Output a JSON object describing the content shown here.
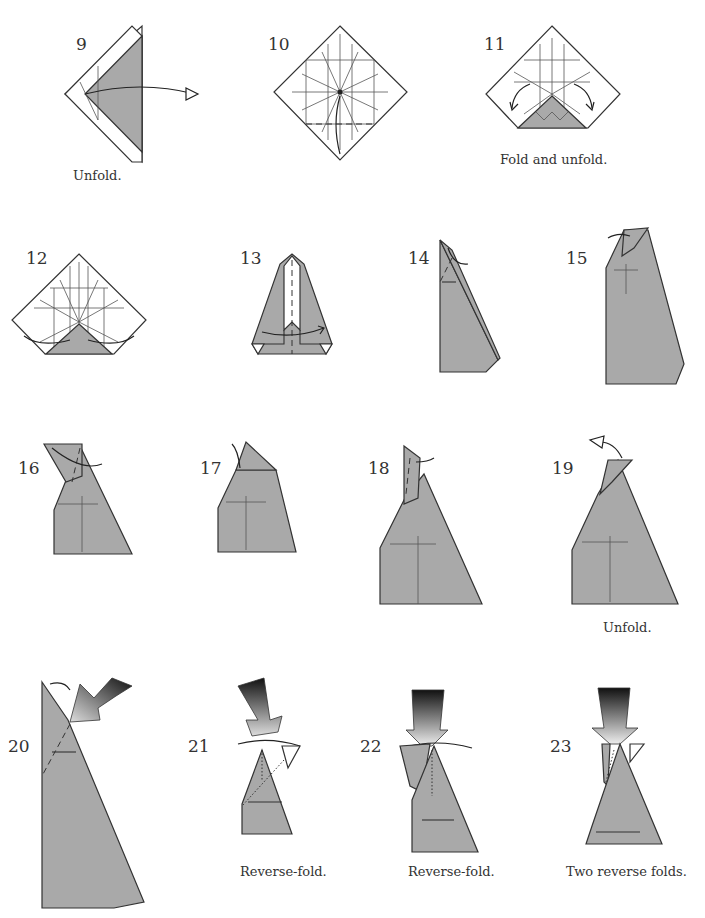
{
  "diagram": {
    "colors": {
      "paper": "#a9a9a9",
      "line": "#333333",
      "background": "#ffffff"
    },
    "steps": [
      {
        "number": "9",
        "caption": "Unfold."
      },
      {
        "number": "10",
        "caption": ""
      },
      {
        "number": "11",
        "caption": "Fold and unfold."
      },
      {
        "number": "12",
        "caption": ""
      },
      {
        "number": "13",
        "caption": ""
      },
      {
        "number": "14",
        "caption": ""
      },
      {
        "number": "15",
        "caption": ""
      },
      {
        "number": "16",
        "caption": ""
      },
      {
        "number": "17",
        "caption": ""
      },
      {
        "number": "18",
        "caption": ""
      },
      {
        "number": "19",
        "caption": "Unfold."
      },
      {
        "number": "20",
        "caption": ""
      },
      {
        "number": "21",
        "caption": "Reverse-fold."
      },
      {
        "number": "22",
        "caption": "Reverse-fold."
      },
      {
        "number": "23",
        "caption": "Two reverse folds."
      }
    ]
  }
}
